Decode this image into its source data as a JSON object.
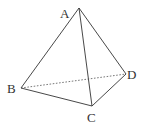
{
  "diagram": {
    "type": "tetrahedron",
    "vertices": {
      "A": {
        "label": "A",
        "x": 79,
        "y": 8,
        "lx": 60,
        "ly": 18
      },
      "B": {
        "label": "B",
        "x": 21,
        "y": 88,
        "lx": 7,
        "ly": 93
      },
      "C": {
        "label": "C",
        "x": 92,
        "y": 106,
        "lx": 87,
        "ly": 122
      },
      "D": {
        "label": "D",
        "x": 126,
        "y": 74,
        "lx": 127,
        "ly": 79
      }
    },
    "edges": [
      {
        "from": "A",
        "to": "B",
        "style": "solid"
      },
      {
        "from": "A",
        "to": "C",
        "style": "solid"
      },
      {
        "from": "A",
        "to": "D",
        "style": "solid"
      },
      {
        "from": "B",
        "to": "C",
        "style": "solid"
      },
      {
        "from": "C",
        "to": "D",
        "style": "solid"
      },
      {
        "from": "B",
        "to": "D",
        "style": "dashed"
      }
    ],
    "colors": {
      "line": "#333333",
      "background": "#ffffff"
    }
  }
}
